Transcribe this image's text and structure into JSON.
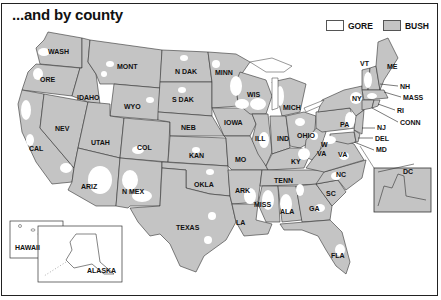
{
  "title": "...and by county",
  "legend": {
    "items": [
      {
        "label": "GORE",
        "color": "#ffffff"
      },
      {
        "label": "BUSH",
        "color": "#c4c4c4"
      }
    ]
  },
  "colors": {
    "bush": "#c4c4c4",
    "gore": "#ffffff",
    "border": "#333333"
  },
  "states": {
    "wash": "WASH",
    "ore": "ORE",
    "idaho": "IDAHO",
    "mont": "MONT",
    "wyo": "WYO",
    "n_dak": "N DAK",
    "s_dak": "S DAK",
    "minn": "MINN",
    "wis": "WIS",
    "mich": "MICH",
    "nev": "NEV",
    "cal": "CAL",
    "utah": "UTAH",
    "col": "COL",
    "neb": "NEB",
    "kan": "KAN",
    "iowa": "IOWA",
    "ill": "ILL",
    "ind": "IND",
    "ohio": "OHIO",
    "mo": "MO",
    "ky": "KY",
    "w_va_1": "W",
    "w_va_2": "VA",
    "va": "VA",
    "pa": "PA",
    "ny": "NY",
    "vt": "VT",
    "me": "ME",
    "nh": "NH",
    "mass": "MASS",
    "ri": "RI",
    "conn": "CONN",
    "nj": "NJ",
    "del": "DEL",
    "md": "MD",
    "ariz": "ARIZ",
    "n_mex": "N MEX",
    "okla": "OKLA",
    "ark": "ARK",
    "tenn": "TENN",
    "nc": "NC",
    "sc": "SC",
    "texas": "TEXAS",
    "la": "LA",
    "miss": "MISS",
    "ala": "ALA",
    "ga": "GA",
    "fla": "FLA",
    "dc": "DC",
    "hawaii": "HAWAII",
    "alaska": "ALASKA"
  }
}
